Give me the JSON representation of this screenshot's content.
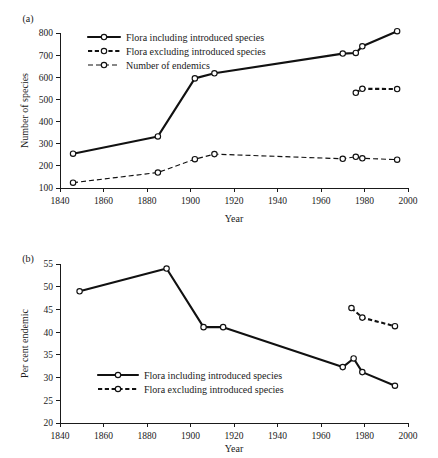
{
  "figure": {
    "panel_a_label": "(a)",
    "panel_b_label": "(b)",
    "background_color": "#ffffff",
    "line_color": "#111111",
    "marker_fill": "#ffffff"
  },
  "chart_data": [
    {
      "id": "panel-a",
      "type": "line",
      "title": "(a)",
      "xlabel": "Year",
      "ylabel": "Number of species",
      "xlim": [
        1840,
        2000
      ],
      "ylim": [
        100,
        800
      ],
      "xticks": [
        1840,
        1860,
        1880,
        1900,
        1920,
        1940,
        1960,
        1980,
        2000
      ],
      "yticks": [
        100,
        200,
        300,
        400,
        500,
        600,
        700,
        800
      ],
      "grid": false,
      "legend_position": "top-left",
      "series": [
        {
          "name": "Flora including introduced species",
          "style": "solid",
          "marker": "open-circle",
          "x": [
            1846,
            1885,
            1902,
            1911,
            1970,
            1976,
            1979,
            1995
          ],
          "values": [
            255,
            333,
            595,
            618,
            707,
            710,
            740,
            808
          ]
        },
        {
          "name": "Flora excluding introduced species",
          "style": "dashed-heavy",
          "marker": "open-circle",
          "x": [
            1976,
            1979,
            1995
          ],
          "values": [
            530,
            548,
            547
          ]
        },
        {
          "name": "Number of endemics",
          "style": "dashed-light",
          "marker": "open-circle",
          "x": [
            1846,
            1885,
            1902,
            1911,
            1970,
            1976,
            1979,
            1995
          ],
          "values": [
            124,
            170,
            230,
            253,
            232,
            241,
            234,
            228
          ]
        }
      ]
    },
    {
      "id": "panel-b",
      "type": "line",
      "title": "(b)",
      "xlabel": "Year",
      "ylabel": "Per cent endemic",
      "xlim": [
        1840,
        2000
      ],
      "ylim": [
        20,
        55
      ],
      "xticks": [
        1840,
        1860,
        1880,
        1900,
        1920,
        1940,
        1960,
        1980,
        2000
      ],
      "yticks": [
        20,
        25,
        30,
        35,
        40,
        45,
        50,
        55
      ],
      "grid": false,
      "legend_position": "bottom-left",
      "series": [
        {
          "name": "Flora including introduced species",
          "style": "solid",
          "marker": "open-circle",
          "x": [
            1849,
            1889,
            1906,
            1915,
            1970,
            1975,
            1979,
            1994
          ],
          "values": [
            49.0,
            54.0,
            41.1,
            41.1,
            32.3,
            34.2,
            31.2,
            28.2
          ]
        },
        {
          "name": "Flora excluding introduced species",
          "style": "dashed-heavy",
          "marker": "open-circle",
          "x": [
            1974,
            1979,
            1994
          ],
          "values": [
            45.3,
            43.2,
            41.3
          ]
        }
      ]
    }
  ],
  "panel_a": {
    "label": "(a)",
    "y_axis_title": "Number of species",
    "x_axis_title": "Year",
    "y_tick_labels": [
      "800",
      "700",
      "600",
      "500",
      "400",
      "300",
      "200",
      "100"
    ],
    "x_tick_labels": [
      "1840",
      "1860",
      "1880",
      "1900",
      "1920",
      "1940",
      "1960",
      "1980",
      "2000"
    ],
    "legend": [
      {
        "label": "Flora including introduced species",
        "style": "solid"
      },
      {
        "label": "Flora excluding introduced species",
        "style": "dashed-heavy"
      },
      {
        "label": "Number of endemics",
        "style": "dashed-light"
      }
    ]
  },
  "panel_b": {
    "label": "(b)",
    "y_axis_title": "Per cent endemic",
    "x_axis_title": "Year",
    "y_tick_labels": [
      "55",
      "50",
      "45",
      "40",
      "35",
      "30",
      "25",
      "20"
    ],
    "x_tick_labels": [
      "1840",
      "1860",
      "1880",
      "1900",
      "1920",
      "1940",
      "1960",
      "1980",
      "2000"
    ],
    "legend": [
      {
        "label": "Flora including introduced species",
        "style": "solid"
      },
      {
        "label": "Flora excluding introduced species",
        "style": "dashed-heavy"
      }
    ]
  }
}
